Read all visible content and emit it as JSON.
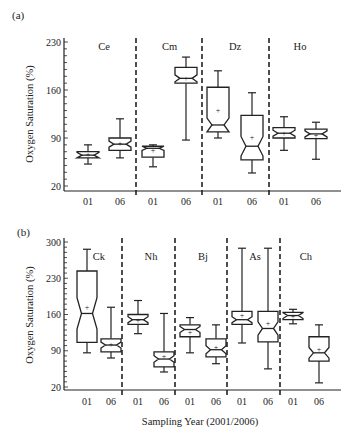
{
  "figure": {
    "x_axis_title": "Sampling Year (2001/2006)",
    "y_axis_title": "Oxygen Saturation (%)"
  },
  "chart_data": [
    {
      "panel": "(a)",
      "type": "box",
      "ylabel": "Oxygen Saturation (%)",
      "ylim": [
        20,
        230
      ],
      "yticks": [
        20,
        90,
        160,
        230
      ],
      "groups": [
        "Ce",
        "Cm",
        "Dz",
        "Ho"
      ],
      "categories": [
        "01",
        "06"
      ],
      "grid": false,
      "boxes": [
        {
          "group": "Ce",
          "year": "01",
          "whisker_low": 52,
          "q1": 61,
          "median": 65,
          "q3": 70,
          "whisker_high": 80,
          "mean": 66
        },
        {
          "group": "Ce",
          "year": "06",
          "whisker_low": 61,
          "q1": 72,
          "median": 81,
          "q3": 90,
          "whisker_high": 118,
          "mean": 82
        },
        {
          "group": "Cm",
          "year": "01",
          "whisker_low": 48,
          "q1": 62,
          "median": 75,
          "q3": 78,
          "whisker_high": 80,
          "mean": 73
        },
        {
          "group": "Cm",
          "year": "06",
          "whisker_low": 87,
          "q1": 170,
          "median": 177,
          "q3": 193,
          "whisker_high": 208,
          "mean": 177
        },
        {
          "group": "Dz",
          "year": "01",
          "whisker_low": 90,
          "q1": 99,
          "median": 109,
          "q3": 164,
          "whisker_high": 188,
          "mean": 131
        },
        {
          "group": "Dz",
          "year": "06",
          "whisker_low": 39,
          "q1": 58,
          "median": 78,
          "q3": 123,
          "whisker_high": 156,
          "mean": 91
        },
        {
          "group": "Ho",
          "year": "01",
          "whisker_low": 72,
          "q1": 90,
          "median": 97,
          "q3": 105,
          "whisker_high": 121,
          "mean": 97
        },
        {
          "group": "Ho",
          "year": "06",
          "whisker_low": 59,
          "q1": 89,
          "median": 96,
          "q3": 103,
          "whisker_high": 113,
          "mean": 95
        }
      ]
    },
    {
      "panel": "(b)",
      "type": "box",
      "xlabel": "Sampling Year (2001/2006)",
      "ylabel": "Oxygen Saturation (%)",
      "ylim": [
        20,
        300
      ],
      "yticks": [
        20,
        90,
        160,
        230,
        300
      ],
      "groups": [
        "Ck",
        "Nh",
        "Bj",
        "As",
        "Ch"
      ],
      "categories": [
        "01",
        "06"
      ],
      "grid": false,
      "boxes": [
        {
          "group": "Ck",
          "year": "01",
          "whisker_low": 86,
          "q1": 106,
          "median": 162,
          "q3": 244,
          "whisker_high": 286,
          "mean": 175
        },
        {
          "group": "Ck",
          "year": "06",
          "whisker_low": 76,
          "q1": 88,
          "median": 101,
          "q3": 113,
          "whisker_high": 174,
          "mean": 104
        },
        {
          "group": "Nh",
          "year": "01",
          "whisker_low": 123,
          "q1": 141,
          "median": 150,
          "q3": 160,
          "whisker_high": 187,
          "mean": 150
        },
        {
          "group": "Nh",
          "year": "06",
          "whisker_low": 49,
          "q1": 59,
          "median": 74,
          "q3": 88,
          "whisker_high": 162,
          "mean": 80
        },
        {
          "group": "Bj",
          "year": "01",
          "whisker_low": 86,
          "q1": 117,
          "median": 131,
          "q3": 140,
          "whisker_high": 154,
          "mean": 126
        },
        {
          "group": "Bj",
          "year": "06",
          "whisker_low": 65,
          "q1": 78,
          "median": 92,
          "q3": 113,
          "whisker_high": 140,
          "mean": 97
        },
        {
          "group": "As",
          "year": "01",
          "whisker_low": 105,
          "q1": 141,
          "median": 150,
          "q3": 166,
          "whisker_high": 288,
          "mean": 160
        },
        {
          "group": "As",
          "year": "06",
          "whisker_low": 55,
          "q1": 107,
          "median": 133,
          "q3": 166,
          "whisker_high": 288,
          "mean": 144
        },
        {
          "group": "Ch",
          "year": "01",
          "whisker_low": 142,
          "q1": 150,
          "median": 158,
          "q3": 164,
          "whisker_high": 170,
          "mean": 157
        },
        {
          "group": "Ch",
          "year": "06",
          "whisker_low": 28,
          "q1": 70,
          "median": 86,
          "q3": 117,
          "whisker_high": 140,
          "mean": 93
        }
      ]
    }
  ]
}
